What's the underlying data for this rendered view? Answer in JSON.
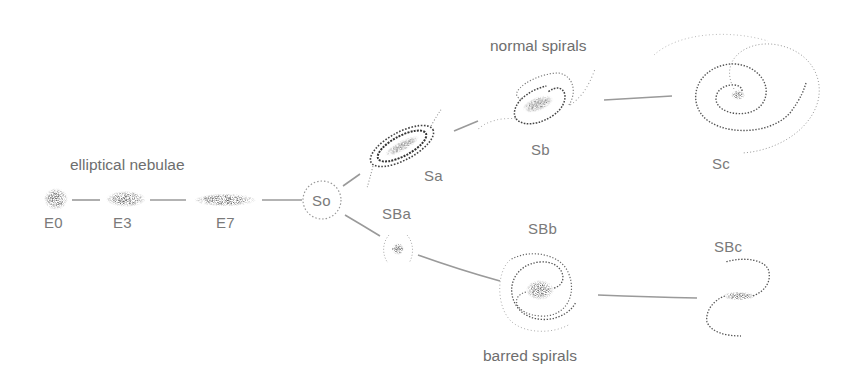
{
  "diagram": {
    "groups": {
      "elliptical": "elliptical nebulae",
      "normal": "normal spirals",
      "barred": "barred spirals"
    },
    "nodes": [
      {
        "id": "E0",
        "label": "E0",
        "type": "elliptical"
      },
      {
        "id": "E3",
        "label": "E3",
        "type": "elliptical"
      },
      {
        "id": "E7",
        "label": "E7",
        "type": "elliptical"
      },
      {
        "id": "So",
        "label": "So",
        "type": "lenticular"
      },
      {
        "id": "Sa",
        "label": "Sa",
        "type": "normal spiral"
      },
      {
        "id": "Sb",
        "label": "Sb",
        "type": "normal spiral"
      },
      {
        "id": "Sc",
        "label": "Sc",
        "type": "normal spiral"
      },
      {
        "id": "SBa",
        "label": "SBa",
        "type": "barred spiral"
      },
      {
        "id": "SBb",
        "label": "SBb",
        "type": "barred spiral"
      },
      {
        "id": "SBc",
        "label": "SBc",
        "type": "barred spiral"
      }
    ],
    "edges": [
      [
        "E0",
        "E3"
      ],
      [
        "E3",
        "E7"
      ],
      [
        "E7",
        "So"
      ],
      [
        "So",
        "Sa"
      ],
      [
        "Sa",
        "Sb"
      ],
      [
        "Sb",
        "Sc"
      ],
      [
        "So",
        "SBa"
      ],
      [
        "SBa",
        "SBb"
      ],
      [
        "SBb",
        "SBc"
      ]
    ],
    "colors": {
      "line": "#9a9a9a",
      "text": "#757575",
      "stipple": "#333333"
    }
  }
}
